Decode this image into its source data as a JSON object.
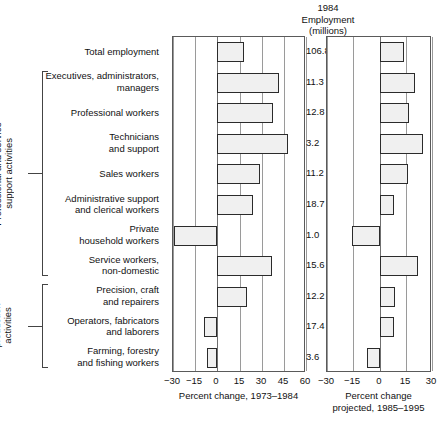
{
  "header": {
    "line1": "1984",
    "line2": "Employment",
    "line3": "(millions)"
  },
  "groups": [
    {
      "name": "professional-and-service",
      "label": "Professional and service\nsupport activities",
      "first_row": 1,
      "last_row": 7
    },
    {
      "name": "direct-production",
      "label": "Direct\nproduction\nactivities",
      "first_row": 8,
      "last_row": 10
    }
  ],
  "axis_titles": {
    "left": "Percent change, 1973–1984",
    "right": "Percent change\nprojected, 1985–1995"
  },
  "chart_data": {
    "type": "bar",
    "title": "1984 Employment (millions)",
    "orientation": "horizontal",
    "grid": true,
    "legend": "none",
    "categories": [
      "Total employment",
      "Executives, administrators,\nmanagers",
      "Professional workers",
      "Technicians\nand support",
      "Sales workers",
      "Administrative support\nand clerical workers",
      "Private\nhousehold workers",
      "Service workers,\nnon-domestic",
      "Precision, craft\nand repairers",
      "Operators, fabricators\nand laborers",
      "Farming, forestry\nand fishing workers"
    ],
    "employment_millions": [
      106.8,
      11.3,
      12.8,
      3.2,
      11.2,
      18.7,
      1.0,
      15.6,
      12.2,
      17.4,
      3.6
    ],
    "series": [
      {
        "name": "Percent change, 1973–1984",
        "xlabel": "Percent change, 1973–1984",
        "xlim": [
          -30,
          60
        ],
        "xticks": [
          -30,
          -15,
          0,
          15,
          30,
          45,
          60
        ],
        "xticklabels": [
          "−30",
          "−15",
          "0",
          "15",
          "30",
          "45",
          "60"
        ],
        "values": [
          18,
          42,
          38,
          48,
          29,
          24,
          -29,
          37,
          20,
          -9,
          -7
        ]
      },
      {
        "name": "Percent change projected, 1985–1995",
        "xlabel": "Percent change\nprojected, 1985–1995",
        "xlim": [
          -30,
          30
        ],
        "xticks": [
          -30,
          -15,
          0,
          15,
          30
        ],
        "xticklabels": [
          "−30",
          "−15",
          "0",
          "15",
          "30"
        ],
        "values": [
          14,
          20,
          17,
          25,
          16,
          8,
          -16,
          22,
          9,
          8,
          -7
        ]
      }
    ]
  }
}
